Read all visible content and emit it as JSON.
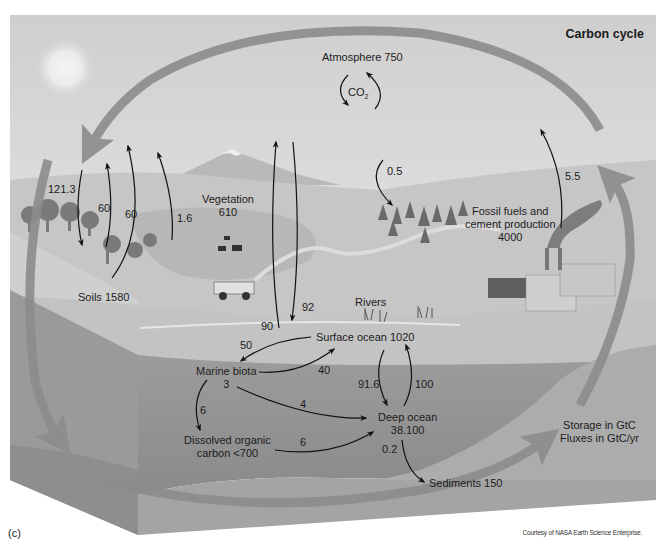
{
  "diagram": {
    "title": "Carbon cycle",
    "panel_label": "(c)",
    "credit": "Courtesy of NASA Earth Science Enterprise.",
    "legend": {
      "storage_units": "Storage in GtC",
      "flux_units": "Fluxes in GtC/yr"
    },
    "co2_label": "CO",
    "co2_subscript": "2",
    "reservoirs": {
      "atmosphere": "Atmosphere 750",
      "vegetation_name": "Vegetation",
      "vegetation_value": "610",
      "soils": "Soils 1580",
      "fossil_line1": "Fossil fuels and",
      "fossil_line2": "cement production",
      "fossil_value": "4000",
      "rivers": "Rivers",
      "surface_ocean": "Surface ocean 1020",
      "marine_biota_name": "Marine biota",
      "marine_biota_value": "3",
      "doc_line1": "Dissolved organic",
      "doc_line2": "carbon <700",
      "deep_ocean_name": "Deep ocean",
      "deep_ocean_value": "38.100",
      "sediments": "Sediments 150"
    },
    "fluxes": {
      "atm_to_land": "121.3",
      "land_to_atm_a": "60",
      "land_to_atm_b": "60",
      "landuse": "1.6",
      "atm_to_forest": "0.5",
      "fossil_emission": "5.5",
      "ocean_to_atm": "90",
      "atm_to_ocean": "92",
      "surface_to_biota": "50",
      "biota_to_surface": "40",
      "biota_to_doc": "6",
      "biota_to_deep": "4",
      "doc_to_deep": "6",
      "surface_to_deep": "91.6",
      "deep_to_surface": "100",
      "deep_to_sediments": "0.2"
    },
    "colors": {
      "sky": "#d9d9d9",
      "land_light": "#c4c4c4",
      "land_mid": "#b0b0b0",
      "ocean_surface": "#bdbdbd",
      "ocean_deep": "#8f8f8f",
      "seabed": "#a8a8a8",
      "cycle_arrow": "#8a8a8a",
      "flux_arrow": "#111111"
    }
  }
}
